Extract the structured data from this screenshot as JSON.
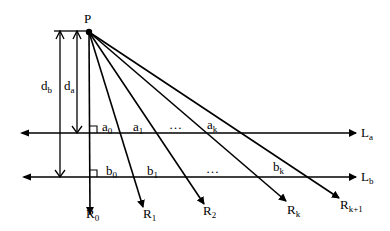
{
  "diagram": {
    "point": {
      "label": "P",
      "x": 89,
      "y": 32
    },
    "lines": [
      {
        "id": "La",
        "label": "L",
        "sub": "a",
        "y": 133
      },
      {
        "id": "Lb",
        "label": "L",
        "sub": "b",
        "y": 177
      }
    ],
    "rays": [
      {
        "label": "R",
        "sub": "0",
        "end": [
          90,
          214
        ]
      },
      {
        "label": "R",
        "sub": "1",
        "end": [
          143,
          207
        ]
      },
      {
        "label": "R",
        "sub": "2",
        "end": [
          204,
          204
        ]
      },
      {
        "label": "R",
        "sub": "k",
        "end": [
          286,
          201
        ]
      },
      {
        "label": "R",
        "sub": "k+1",
        "end": [
          339,
          198
        ]
      }
    ],
    "distances": [
      {
        "label": "d",
        "sub": "b",
        "x": 60,
        "y_top": 31,
        "y_bottom": 177
      },
      {
        "label": "d",
        "sub": "a",
        "x": 77,
        "y_top": 31,
        "y_bottom": 133
      }
    ],
    "segment_labels_a": [
      {
        "label": "a",
        "sub": "0"
      },
      {
        "label": "a",
        "sub": "1"
      },
      {
        "label": "…",
        "sub": ""
      },
      {
        "label": "a",
        "sub": "k"
      }
    ],
    "segment_labels_b": [
      {
        "label": "b",
        "sub": "0"
      },
      {
        "label": "b",
        "sub": "1"
      },
      {
        "label": "…",
        "sub": ""
      },
      {
        "label": "b",
        "sub": "k"
      }
    ]
  }
}
